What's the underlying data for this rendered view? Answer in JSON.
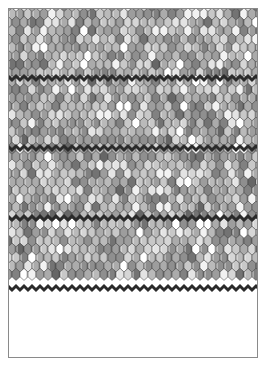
{
  "page": {
    "width": 269,
    "height": 374,
    "background_color": "#ffffff"
  },
  "artwork": {
    "name": "hexagonal-roof-tile-pattern",
    "description": "Grid of overlapping shield/hexagon roof tiles rendered in randomized grayscale values, interrupted by darker horizontal ridge bands.",
    "bounds": {
      "x": 8,
      "y": 8,
      "width": 250,
      "height": 350
    },
    "tile": {
      "width": 8,
      "height": 12,
      "shoulder_ratio": 0.3,
      "shape": "shield-hexagon"
    },
    "grid": {
      "columns": 32,
      "rows": 30,
      "row_offset_alternating": false
    },
    "stroke": {
      "color": "#3c3c3c",
      "width": 0.5
    },
    "outer_border": {
      "color": "#8a8a8a",
      "width": 1
    },
    "ridge_bands": {
      "y_positions": [
        78,
        148,
        218,
        288
      ],
      "thickness": 3,
      "color": "#2a2a2a"
    },
    "palette": [
      "#ffffff",
      "#f2f2f2",
      "#e4e4e4",
      "#d6d6d6",
      "#c8c8c8",
      "#bababa",
      "#ababab",
      "#9d9d9d",
      "#8f8f8f",
      "#818181",
      "#737373",
      "#666666"
    ],
    "palette_weights": [
      4,
      5,
      7,
      9,
      11,
      13,
      14,
      13,
      11,
      7,
      4,
      2
    ],
    "highlight_color": "#ffffff",
    "shadow_color": "#5e5e5e",
    "seed": 20240917
  }
}
